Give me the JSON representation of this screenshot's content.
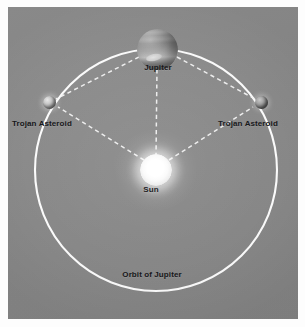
{
  "figure": {
    "background_color": "#8a8a8a",
    "frame_color": "#fdfdfd",
    "line_color": "#fbfbfb",
    "label_color": "#17171a"
  },
  "labels": {
    "jupiter": "Jupiter",
    "sun": "Sun",
    "trojan_left": "Trojan Asteroid",
    "trojan_right": "Trojan Asteroid",
    "orbit": "Orbit of Jupiter"
  },
  "bodies": [
    {
      "name": "sun",
      "label": "Sun",
      "cx": 148,
      "cy": 163,
      "r": 16
    },
    {
      "name": "jupiter",
      "label": "Jupiter",
      "cx": 150,
      "cy": 42,
      "r": 20.5
    },
    {
      "name": "trojan-left",
      "label": "Trojan Asteroid",
      "cx": 41,
      "cy": 95,
      "r": 6.5
    },
    {
      "name": "trojan-right",
      "label": "Trojan Asteroid",
      "cx": 253,
      "cy": 95,
      "r": 6.5
    }
  ],
  "orbit": {
    "label": "Orbit of Jupiter",
    "cx": 148,
    "cy": 163,
    "r": 121,
    "stroke": "#fbfbfb",
    "stroke_width": 2.1
  },
  "connections": [
    {
      "name": "sun-to-jupiter",
      "from": "sun",
      "to": "jupiter",
      "style": "dashed"
    },
    {
      "name": "sun-to-trojan-left",
      "from": "sun",
      "to": "trojan-left",
      "style": "dashed"
    },
    {
      "name": "sun-to-trojan-right",
      "from": "sun",
      "to": "trojan-right",
      "style": "dashed"
    },
    {
      "name": "jupiter-to-trojan-left",
      "from": "jupiter",
      "to": "trojan-left",
      "style": "dashed"
    },
    {
      "name": "jupiter-to-trojan-right",
      "from": "jupiter",
      "to": "trojan-right",
      "style": "dashed"
    }
  ]
}
